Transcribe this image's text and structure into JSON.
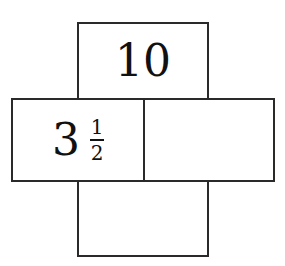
{
  "diagram": {
    "type": "cross-shaped box arrangement",
    "boxes": {
      "top": {
        "value": "10"
      },
      "left": {
        "whole": "3",
        "numerator": "1",
        "denominator": "2"
      },
      "right": {
        "value": ""
      },
      "bottom": {
        "value": ""
      }
    }
  }
}
